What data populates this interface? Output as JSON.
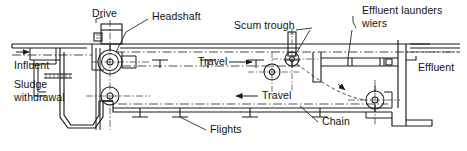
{
  "figure": {
    "type": "engineering-cross-section",
    "line_color": "#1a1a1a",
    "background_color": "#ffffff"
  },
  "labels": {
    "drive": "Drive",
    "headshaft": "Headshaft",
    "scum_trough": "Scum trough",
    "effluent_launders": "Effluent launders",
    "wiers": "wiers",
    "effluent": "Effluent",
    "influent": "Influent",
    "sludge": "Sludge",
    "withdrawal": "withdrawal",
    "travel_top": "Travel",
    "travel_bottom": "Travel",
    "flights": "Flights",
    "chain": "Chain"
  },
  "flow_arrows": [
    {
      "name": "travel-top-arrow",
      "direction": "right",
      "label": "Travel"
    },
    {
      "name": "travel-bottom-arrow",
      "direction": "left",
      "label": "Travel"
    },
    {
      "name": "influent-arrow",
      "direction": "right"
    },
    {
      "name": "scum-flow-arrow",
      "direction": "down-left"
    }
  ],
  "components": [
    {
      "name": "drive-unit",
      "description": "motor drive housing above headshaft"
    },
    {
      "name": "headshaft-sprocket",
      "description": "driven sprocket at influent end"
    },
    {
      "name": "return-sprocket-lower-left",
      "description": "lower left chain sprocket"
    },
    {
      "name": "return-sprocket-lower-right",
      "description": "lower right chain sprocket"
    },
    {
      "name": "scum-trough-sprocket",
      "description": "upper right chain sprocket near scum trough"
    },
    {
      "name": "sludge-hopper",
      "description": "trapezoidal sludge collection hopper at influent end"
    },
    {
      "name": "effluent-launder-trough",
      "description": "effluent launder with weirs at far end"
    },
    {
      "name": "chain-and-flight-collector",
      "description": "continuous chain carrying scraper flights"
    },
    {
      "name": "water-surface-line",
      "description": "dash-dot water level line"
    }
  ]
}
